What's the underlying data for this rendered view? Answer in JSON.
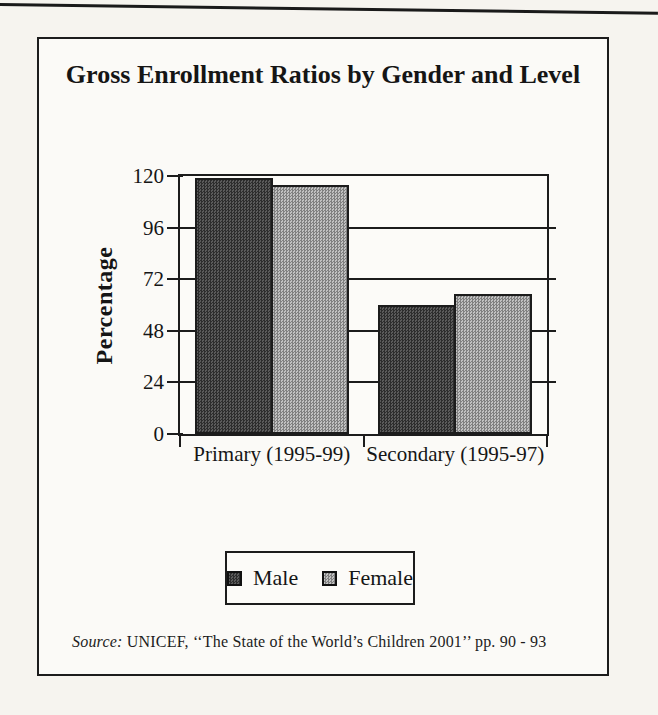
{
  "chart_data": {
    "type": "bar",
    "title": "Gross Enrollment Ratios by Gender and Level",
    "categories": [
      "Primary (1995-99)",
      "Secondary (1995-97)"
    ],
    "series": [
      {
        "name": "Male",
        "values": [
          119,
          60
        ],
        "color": "#404040"
      },
      {
        "name": "Female",
        "values": [
          116,
          65
        ],
        "color": "#b7b7b7"
      }
    ],
    "xlabel": "",
    "ylabel": "Percentage",
    "ylim": [
      0,
      120
    ],
    "yticks": [
      0,
      24,
      48,
      72,
      96,
      120
    ],
    "grid": true,
    "legend_position": "bottom-center",
    "bar_border_color": "#1c1c1c",
    "frame_color": "#1c1c1c"
  },
  "source": {
    "prefix": "Source:",
    "text": " UNICEF, ‘‘The State of the World’s Children 2001’’ pp. 90 - 93"
  }
}
